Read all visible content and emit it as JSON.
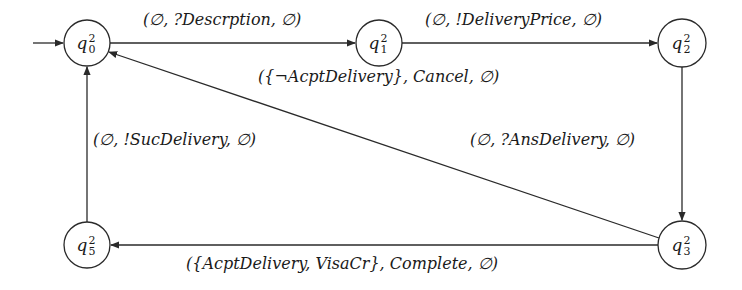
{
  "diagram": {
    "type": "state-machine",
    "nodes": [
      {
        "id": "q0",
        "base": "q",
        "sub": "0",
        "sup": "2",
        "cx": 87,
        "cy": 43,
        "r": 23,
        "initial": true
      },
      {
        "id": "q1",
        "base": "q",
        "sub": "1",
        "sup": "2",
        "cx": 379,
        "cy": 43,
        "r": 23
      },
      {
        "id": "q2",
        "base": "q",
        "sub": "2",
        "sup": "2",
        "cx": 682,
        "cy": 43,
        "r": 24
      },
      {
        "id": "q3",
        "base": "q",
        "sub": "3",
        "sup": "2",
        "cx": 682,
        "cy": 245,
        "r": 24
      },
      {
        "id": "q5",
        "base": "q",
        "sub": "5",
        "sup": "2",
        "cx": 87,
        "cy": 245,
        "r": 23
      }
    ],
    "edges": [
      {
        "from": "q0",
        "to": "q1",
        "label": "(∅, ?Descrption, ∅)"
      },
      {
        "from": "q1",
        "to": "q2",
        "label": "(∅, !DeliveryPrice, ∅)"
      },
      {
        "from": "q2",
        "to": "q3",
        "label": "(∅, ?AnsDelivery, ∅)"
      },
      {
        "from": "q3",
        "to": "q0",
        "label": "({¬AcptDelivery}, Cancel, ∅)"
      },
      {
        "from": "q3",
        "to": "q5",
        "label": "({AcptDelivery, VisaCr}, Complete, ∅)"
      },
      {
        "from": "q5",
        "to": "q0",
        "label": "(∅, !SucDelivery, ∅)"
      }
    ]
  },
  "labels": {
    "q0_q1": "(∅, ?Descrption, ∅)",
    "q1_q2": "(∅, !DeliveryPrice, ∅)",
    "q2_q3": "(∅, ?AnsDelivery, ∅)",
    "q3_q0": "({¬AcptDelivery}, Cancel, ∅)",
    "q3_q5": "({AcptDelivery, VisaCr}, Complete, ∅)",
    "q5_q0": "(∅, !SucDelivery, ∅)"
  },
  "nodes": {
    "q0": {
      "base": "q",
      "sup": "2",
      "sub": "0"
    },
    "q1": {
      "base": "q",
      "sup": "2",
      "sub": "1"
    },
    "q2": {
      "base": "q",
      "sup": "2",
      "sub": "2"
    },
    "q3": {
      "base": "q",
      "sup": "2",
      "sub": "3"
    },
    "q5": {
      "base": "q",
      "sup": "2",
      "sub": "5"
    }
  },
  "colors": {
    "stroke": "#2a2a2a",
    "text": "#1a1a1a",
    "background": "#ffffff"
  }
}
